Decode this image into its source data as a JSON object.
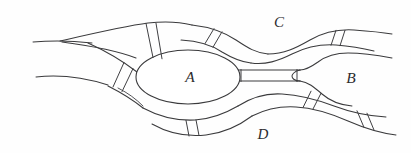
{
  "figure": {
    "type": "line-diagram",
    "background_color": "#fefefe",
    "line_color": "#3a3a3c",
    "width": 411,
    "height": 153
  },
  "nodes": [
    {
      "id": "A",
      "label": "A",
      "shape": "ellipse",
      "cx": 188,
      "cy": 77,
      "rx": 52,
      "ry": 27,
      "label_x": 190,
      "label_y": 82
    },
    {
      "id": "B",
      "label": "B",
      "shape": "region",
      "label_x": 351,
      "label_y": 83
    }
  ],
  "regions": [
    {
      "id": "C",
      "label": "C",
      "position": "upper-right",
      "label_x": 279,
      "label_y": 27
    },
    {
      "id": "D",
      "label": "D",
      "position": "lower-center",
      "label_x": 263,
      "label_y": 139
    }
  ],
  "gates": [
    {
      "id": "gate-upper-left",
      "on_channel": "left-upper-to-A",
      "count": 2
    },
    {
      "id": "gate-upper-right",
      "on_channel": "A-to-C",
      "count": 2
    },
    {
      "id": "gate-lower-left",
      "on_channel": "left-lower-to-A",
      "count": 2
    },
    {
      "id": "gate-lower-center",
      "on_channel": "A-to-D",
      "count": 2
    },
    {
      "id": "gate-right-upper",
      "on_channel": "C-right-branch",
      "count": 2
    },
    {
      "id": "gate-lower-right-inner",
      "on_channel": "B-to-D-lower",
      "count": 2
    },
    {
      "id": "gate-lower-right-outer",
      "on_channel": "D-right-exit",
      "count": 2
    }
  ],
  "channels": [
    {
      "id": "left-inflow",
      "from": "left-edge",
      "to": "split"
    },
    {
      "id": "left-upper-to-A",
      "from": "split",
      "to": "A"
    },
    {
      "id": "left-lower-to-A",
      "from": "split",
      "to": "A"
    },
    {
      "id": "A-to-C",
      "from": "A",
      "to": "C"
    },
    {
      "id": "A-to-B",
      "from": "A",
      "to": "B"
    },
    {
      "id": "A-to-D",
      "from": "A",
      "to": "D"
    },
    {
      "id": "C-right-branch",
      "from": "C",
      "to": "right-edge"
    },
    {
      "id": "B-to-D-lower",
      "from": "B",
      "to": "D"
    },
    {
      "id": "D-right-exit",
      "from": "D",
      "to": "right-edge"
    }
  ]
}
